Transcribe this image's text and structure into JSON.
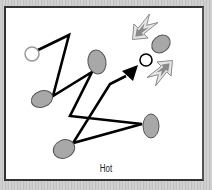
{
  "caption": "Hot",
  "colors": {
    "background": "#c9c9c9",
    "panel": "#ffffff",
    "path": "#000000",
    "node_fill": "#a8a8a8",
    "node_stroke": "#555555",
    "start_circle_stroke": "#999999",
    "pointer_fill": "#d8d8d8",
    "pointer_inner": "#888888"
  },
  "diagram": {
    "start_node": {
      "cx": 32,
      "cy": 54,
      "r": 7,
      "type": "hollow-circle"
    },
    "target_node": {
      "cx": 146,
      "cy": 60,
      "r": 6,
      "type": "hollow-circle"
    },
    "path_points": [
      [
        36,
        51
      ],
      [
        69,
        35
      ],
      [
        53,
        96
      ],
      [
        92,
        72
      ],
      [
        70,
        116
      ],
      [
        142,
        124
      ],
      [
        73,
        143
      ],
      [
        110,
        84
      ],
      [
        126,
        76
      ]
    ],
    "arrowhead": {
      "tip": [
        137,
        66
      ],
      "type": "filled-triangle"
    },
    "ellipses": [
      {
        "cx": 42,
        "cy": 99,
        "rx": 11,
        "ry": 8,
        "rotate": -20
      },
      {
        "cx": 97,
        "cy": 62,
        "rx": 9,
        "ry": 12,
        "rotate": -10
      },
      {
        "cx": 151,
        "cy": 126,
        "rx": 8,
        "ry": 12,
        "rotate": 0
      },
      {
        "cx": 64,
        "cy": 149,
        "rx": 11,
        "ry": 9,
        "rotate": -25
      },
      {
        "cx": 161,
        "cy": 44,
        "rx": 10,
        "ry": 8,
        "rotate": -40
      }
    ],
    "pointers": [
      {
        "label": "hot-indicator-upper-left",
        "cx": 140,
        "cy": 30,
        "rotate": 45
      },
      {
        "label": "hot-indicator-lower-right",
        "cx": 164,
        "cy": 70,
        "rotate": 225
      }
    ]
  }
}
